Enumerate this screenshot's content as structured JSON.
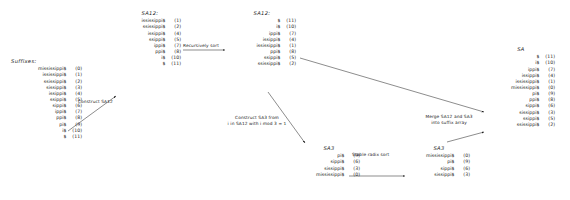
{
  "diagram": {
    "title_string": "mississippi$",
    "blocks": [
      {
        "id": "suffixes",
        "title": "Suffixes:",
        "rows": [
          {
            "suffix": "mississippi$",
            "index": "(0)"
          },
          {
            "suffix": "ississippi$",
            "index": "(1)"
          },
          {
            "suffix": "ssissippi$",
            "index": "(2)"
          },
          {
            "suffix": "sissippi$",
            "index": "(3)"
          },
          {
            "suffix": "issippi$",
            "index": "(4)"
          },
          {
            "suffix": "ssippi$",
            "index": "(5)"
          },
          {
            "suffix": "sippi$",
            "index": "(6)"
          },
          {
            "suffix": "ippi$",
            "index": "(7)"
          },
          {
            "suffix": "ppi$",
            "index": "(8)"
          },
          {
            "suffix": "pi$",
            "index": "(9)"
          },
          {
            "suffix": "i$",
            "index": "(10)"
          },
          {
            "suffix": "$",
            "index": "(11)"
          }
        ]
      },
      {
        "id": "sa12-unsorted",
        "title": "SA12:",
        "rows": [
          {
            "suffix": "ississippi$",
            "index": "(1)"
          },
          {
            "suffix": "ssissippi$",
            "index": "(2)"
          },
          {
            "suffix": "issippi$",
            "index": "(4)"
          },
          {
            "suffix": "ssippi$",
            "index": "(5)"
          },
          {
            "suffix": "ippi$",
            "index": "(7)"
          },
          {
            "suffix": "ppi$",
            "index": "(8)"
          },
          {
            "suffix": "i$",
            "index": "(10)"
          },
          {
            "suffix": "$",
            "index": "(11)"
          }
        ]
      },
      {
        "id": "sa12-sorted",
        "title": "SA12:",
        "rows": [
          {
            "suffix": "$",
            "index": "(11)"
          },
          {
            "suffix": "i$",
            "index": "(10)"
          },
          {
            "suffix": "ippi$",
            "index": "(7)"
          },
          {
            "suffix": "issippi$",
            "index": "(4)"
          },
          {
            "suffix": "ississippi$",
            "index": "(1)"
          },
          {
            "suffix": "ppi$",
            "index": "(8)"
          },
          {
            "suffix": "ssippi$",
            "index": "(5)"
          },
          {
            "suffix": "ssissippi$",
            "index": "(2)"
          }
        ]
      },
      {
        "id": "sa3-unsorted",
        "title": "SA3",
        "rows": [
          {
            "suffix": "pi$",
            "index": "(9)"
          },
          {
            "suffix": "sippi$",
            "index": "(6)"
          },
          {
            "suffix": "sissippi$",
            "index": "(3)"
          },
          {
            "suffix": "mississippi$",
            "index": "(0)"
          }
        ]
      },
      {
        "id": "sa3-sorted",
        "title": "SA3",
        "rows": [
          {
            "suffix": "mississippi$",
            "index": "(0)"
          },
          {
            "suffix": "pi$",
            "index": "(9)"
          },
          {
            "suffix": "sippi$",
            "index": "(6)"
          },
          {
            "suffix": "sissippi$",
            "index": "(3)"
          }
        ]
      },
      {
        "id": "sa",
        "title": "SA",
        "rows": [
          {
            "suffix": "$",
            "index": "(11)"
          },
          {
            "suffix": "i$",
            "index": "(10)"
          },
          {
            "suffix": "ippi$",
            "index": "(7)"
          },
          {
            "suffix": "issippi$",
            "index": "(4)"
          },
          {
            "suffix": "ississippi$",
            "index": "(1)"
          },
          {
            "suffix": "mississippi$",
            "index": "(0)"
          },
          {
            "suffix": "pi$",
            "index": "(9)"
          },
          {
            "suffix": "ppi$",
            "index": "(8)"
          },
          {
            "suffix": "sippi$",
            "index": "(6)"
          },
          {
            "suffix": "sissippi$",
            "index": "(3)"
          },
          {
            "suffix": "ssippi$",
            "index": "(5)"
          },
          {
            "suffix": "ssissippi$",
            "index": "(2)"
          }
        ]
      }
    ],
    "arrow_labels": {
      "construct_sa12": "Construct SA12",
      "recursively_sort": "Recursively sort",
      "construct_sa3_line1": "Construct SA3 from",
      "construct_sa3_line2": "i in SA12 with i mod 3 = 1",
      "stable_radix_sort": "Stable radix sort",
      "merge_line1": "Merge SA12 and SA3",
      "merge_line2": "into suffix array"
    },
    "colors": {
      "ink": "#1a1a1a",
      "background": "#ffffff"
    }
  }
}
